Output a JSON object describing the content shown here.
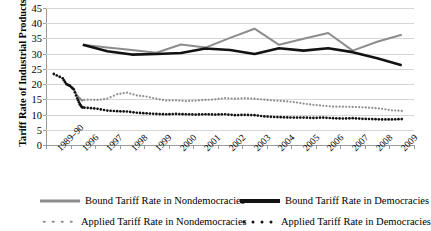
{
  "chart_data": {
    "type": "line",
    "title": "",
    "xlabel": "",
    "ylabel": "Tariff Rate of Industrial Products",
    "ylim": [
      0,
      45
    ],
    "yticks": [
      0,
      5,
      10,
      15,
      20,
      25,
      30,
      35,
      40,
      45
    ],
    "grid": true,
    "legend_position": "bottom",
    "categories": [
      "1989–90",
      "1996",
      "1997",
      "1998",
      "1999",
      "2000",
      "2001",
      "2002",
      "2003",
      "2004",
      "2005",
      "2006",
      "2007",
      "2008",
      "2009"
    ],
    "series": [
      {
        "name": "Bound Tariff Rate in Nondemocracies",
        "style": "line",
        "color": "#8d8d8d",
        "x": [
          "1996",
          "1997",
          "1998",
          "1999",
          "2000",
          "2001",
          "2002",
          "2003",
          "2004",
          "2005",
          "2006",
          "2007",
          "2008",
          "2009"
        ],
        "values": [
          32.9,
          32.0,
          31.2,
          30.3,
          33.0,
          32.0,
          35.2,
          38.2,
          32.9,
          34.9,
          36.8,
          31.0,
          33.9,
          36.2
        ]
      },
      {
        "name": "Bound Tariff Rate in Democracies",
        "style": "line",
        "color": "#121212",
        "x": [
          "1996",
          "1997",
          "1998",
          "1999",
          "2000",
          "2001",
          "2002",
          "2003",
          "2004",
          "2005",
          "2006",
          "2007",
          "2008",
          "2009"
        ],
        "values": [
          32.9,
          30.8,
          29.7,
          29.9,
          30.2,
          31.7,
          31.2,
          29.9,
          31.8,
          31.0,
          31.8,
          30.5,
          28.5,
          26.2
        ]
      },
      {
        "name": "Applied Tariff Rate in Nondemocracies",
        "style": "dotted",
        "color": "#8d8d8d",
        "x": [
          1989.0,
          1990.5,
          1991.5,
          1992.5,
          1993.5,
          1994.5,
          1995.2,
          1995.8,
          1996.2,
          1996.6,
          1997.0,
          1997.4,
          1997.8,
          1998.2,
          1998.6,
          1999.0,
          1999.4,
          1999.8,
          2000.2,
          2000.6,
          2001.0,
          2001.4,
          2001.8,
          2002.2,
          2002.6,
          2003.0,
          2003.4,
          2003.8,
          2004.2,
          2004.6,
          2005.0,
          2005.4,
          2005.8,
          2006.2,
          2006.6,
          2007.0,
          2007.4,
          2007.8,
          2008.2,
          2008.6,
          2009.0
        ],
        "values": [
          23.5,
          22.0,
          20.0,
          19.5,
          18.4,
          16.2,
          15.3,
          14.6,
          14.9,
          14.8,
          15.2,
          16.7,
          17.2,
          16.3,
          15.9,
          15.2,
          14.6,
          14.7,
          14.4,
          14.6,
          14.8,
          15.0,
          15.4,
          15.2,
          15.4,
          15.2,
          14.9,
          14.6,
          14.4,
          14.1,
          13.6,
          13.2,
          12.9,
          12.6,
          12.6,
          12.5,
          12.4,
          12.2,
          11.9,
          11.4,
          11.2
        ]
      },
      {
        "name": "Applied Tariff Rate in Democracies",
        "style": "dotted",
        "color": "#121212",
        "x": [
          1989.0,
          1990.5,
          1991.5,
          1992.5,
          1993.5,
          1994.5,
          1995.2,
          1995.8,
          1996.2,
          1996.6,
          1997.0,
          1997.4,
          1997.8,
          1998.2,
          1998.6,
          1999.0,
          1999.4,
          1999.8,
          2000.2,
          2000.6,
          2001.0,
          2001.4,
          2001.8,
          2002.2,
          2002.6,
          2003.0,
          2003.4,
          2003.8,
          2004.2,
          2004.6,
          2005.0,
          2005.4,
          2005.8,
          2006.2,
          2006.6,
          2007.0,
          2007.4,
          2007.8,
          2008.2,
          2008.6,
          2009.0
        ],
        "values": [
          23.3,
          21.9,
          20.0,
          19.4,
          18.3,
          15.3,
          13.4,
          12.4,
          12.2,
          11.9,
          11.3,
          11.1,
          11.0,
          10.6,
          10.4,
          10.2,
          10.1,
          10.2,
          10.1,
          10.0,
          10.1,
          10.0,
          10.1,
          9.8,
          9.9,
          9.8,
          9.4,
          9.2,
          9.1,
          9.0,
          9.0,
          8.9,
          9.0,
          8.8,
          8.7,
          8.8,
          8.6,
          8.5,
          8.4,
          8.4,
          8.5
        ]
      }
    ]
  },
  "legend": {
    "items": [
      {
        "label": "Bound Tariff Rate in Nondemocracies"
      },
      {
        "label": "Bound Tariff Rate in Democracies"
      },
      {
        "label": "Applied Tariff Rate in Nondemocracies"
      },
      {
        "label": "Applied Tariff Rate in Democracies"
      }
    ]
  },
  "colors": {
    "nondemocracy": "#8d8d8d",
    "democracy": "#121212",
    "grid": "#d6d6d6",
    "axis": "#9a9a9a"
  }
}
